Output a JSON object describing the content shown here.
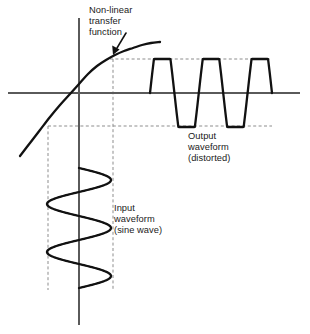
{
  "figure": {
    "width": 310,
    "height": 334,
    "background": "#ffffff",
    "ink_color": "#111111",
    "axis_color": "#5a5a5a",
    "guide_color": "#8d8d8d"
  },
  "labels": {
    "transfer": {
      "line1": "Non-linear",
      "line2": "transfer",
      "line3": "function"
    },
    "output": {
      "line1": "Output",
      "line2": "waveform",
      "line3": "(distorted)"
    },
    "input": {
      "line1": "Input",
      "line2": "waveform",
      "line3": "(sine wave)"
    }
  },
  "chart_data": {
    "type": "line",
    "xlabel": "",
    "ylabel": "",
    "grid": false,
    "legend": "none",
    "axes": {
      "origin_x": 79,
      "origin_y": 93,
      "x_axis_start": 8,
      "x_axis_end": 300,
      "y_axis_start": 18,
      "y_axis_end": 325
    },
    "guides": {
      "saturation_top_y": 59,
      "saturation_bottom_y": 126,
      "input_peak_left_x": 48,
      "input_peak_right_x": 113,
      "dash_right_end": 272,
      "dash_left_end": 48,
      "dash_bottom_end": 290
    },
    "series": [
      {
        "name": "Non-linear transfer function",
        "type": "curve",
        "description": "Linear through origin, saturating (compressing) at both extremes",
        "points": [
          [
            20,
            156
          ],
          [
            30,
            143
          ],
          [
            40,
            130
          ],
          [
            50,
            117
          ],
          [
            60,
            105
          ],
          [
            70,
            94
          ],
          [
            79,
            84
          ],
          [
            88,
            74
          ],
          [
            97,
            66
          ],
          [
            106,
            60
          ],
          [
            115,
            55
          ],
          [
            124,
            51
          ],
          [
            133,
            48
          ],
          [
            142,
            45
          ],
          [
            151,
            43
          ],
          [
            160,
            42
          ]
        ]
      },
      {
        "name": "Output waveform (distorted)",
        "type": "clipped-sine",
        "description": "Flat-topped clipped wave, 2.5 cycles, horizontal time axis",
        "baseline_y": 93,
        "peak_y": 59,
        "trough_y": 126,
        "start_x": 150,
        "end_x": 272,
        "cycles": 2.5
      },
      {
        "name": "Input waveform (sine wave)",
        "type": "sine",
        "description": "Undistorted sine drawn vertically, swinging between the two dashed verticals",
        "center_x": 79,
        "amplitude_px": 32,
        "start_y": 168,
        "end_y": 288,
        "cycles": 2.5
      }
    ],
    "annotations": [
      {
        "text": "Non-linear transfer function",
        "target_x": 116,
        "target_y": 55
      },
      {
        "text": "Output waveform (distorted)",
        "target_x": 222,
        "target_y": 110
      },
      {
        "text": "Input waveform (sine wave)",
        "target_x": 95,
        "target_y": 225
      }
    ]
  }
}
